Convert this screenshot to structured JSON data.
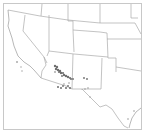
{
  "map": {
    "region": "Southwestern United States",
    "states_visible": [
      "California",
      "Nevada",
      "Oregon",
      "Idaho",
      "Utah",
      "Arizona",
      "Wyoming",
      "Colorado",
      "New Mexico",
      "Nebraska",
      "Kansas",
      "Oklahoma",
      "Texas"
    ],
    "colors": {
      "background": "#ffffff",
      "state_border": "#a9a9a9",
      "frame": "#c8c8c8",
      "occurrence_dot": "#6e6e6e"
    },
    "occurrence_clusters": [
      {
        "area": "Central Arizona (Mogollon Rim diagonal band)",
        "density": "high"
      },
      {
        "area": "Southeastern Arizona",
        "density": "medium"
      },
      {
        "area": "Southwestern New Mexico",
        "density": "low"
      },
      {
        "area": "Southern California",
        "density": "low"
      },
      {
        "area": "West Texas",
        "density": "low"
      }
    ]
  }
}
